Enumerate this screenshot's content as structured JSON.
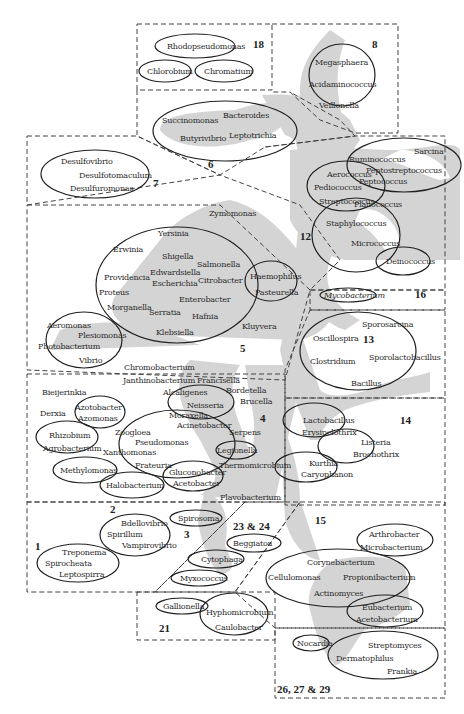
{
  "diagram": {
    "type": "phylogenetic-grouping-map",
    "colors": {
      "shade": "#d4d4d4",
      "line": "#1f1f1f",
      "dash": "#444444",
      "text": "#2b2b2b",
      "background": "#ffffff"
    },
    "groups": [
      {
        "id": "18",
        "label": "18",
        "members": [
          "Rhodopseudomonas",
          "Chlorobium",
          "Chromatium"
        ]
      },
      {
        "id": "8",
        "label": "8",
        "members": [
          "Megasphaera",
          "Acidaminococcus",
          "Veillonella"
        ]
      },
      {
        "id": "6",
        "label": "6",
        "members": [
          "Succinomonas",
          "Bacteroides",
          "Butyrivibrio",
          "Leptotrichia"
        ]
      },
      {
        "id": "7",
        "label": "7",
        "members": [
          "Desulfovibrio",
          "Desulfotomaculum",
          "Desulfuromonas"
        ]
      },
      {
        "id": "12",
        "label": "12",
        "members": [
          "Aerococcus",
          "Pediococcus",
          "Streptococcus",
          "Sarcina",
          "Ruminococcus",
          "Peptostreptococcus",
          "Peptococcus",
          "Planococcus",
          "Staphylococcus",
          "Micrococcus",
          "Deinococcus"
        ]
      },
      {
        "id": "5",
        "label": "5",
        "members": [
          "Zymomonas",
          "Yersinia",
          "Erwinia",
          "Shigella",
          "Salmonella",
          "Edwardsiella",
          "Providencia",
          "Escherichia",
          "Citrobacter",
          "Proteus",
          "Enterobacter",
          "Morganella",
          "Serratia",
          "Hafnia",
          "Klebsiella",
          "Haemophilus",
          "Pasteurella",
          "Kluyvera",
          "Aeromonas",
          "Plesiomonas",
          "Photobacterium",
          "Vibrio",
          "Chromobacterium"
        ]
      },
      {
        "id": "16",
        "label": "16",
        "members": [
          "Mycobacterium"
        ]
      },
      {
        "id": "13",
        "label": "13",
        "members": [
          "Sporosarcina",
          "Oscillospira",
          "Clostridium",
          "Sporolactobacillus",
          "Bacillus"
        ]
      },
      {
        "id": "4",
        "label": "4",
        "members": [
          "Janthinobacterium",
          "Francisella",
          "Bieijerinkia",
          "Alcaligenes",
          "Bordetella",
          "Brucella",
          "Derxia",
          "Azotobacter",
          "Azomonas",
          "Neisseria",
          "Moraxella",
          "Acinetobacter",
          "Serpens",
          "Rhizobium",
          "Agrobacterium",
          "Zoogloea",
          "Pseudomonas",
          "Xanthomonas",
          "Legionella",
          "Frateuria",
          "Thermomicrobium",
          "Methylomonas",
          "Gluconobacter",
          "Acetobacter",
          "Halobacterium",
          "Flavobacterium"
        ]
      },
      {
        "id": "14",
        "label": "14",
        "members": [
          "Lactobacillus",
          "Erysipelothrix",
          "Listeria",
          "Brochothrix",
          "Kurthia",
          "Caryophanon"
        ]
      },
      {
        "id": "1",
        "label": "1",
        "members": [
          "Treponema",
          "Spirocheata",
          "Leptospirra"
        ]
      },
      {
        "id": "2",
        "label": "2",
        "members": [
          "Bdellovibrio",
          "Spirillum",
          "Vampirovibrio"
        ]
      },
      {
        "id": "3",
        "label": "3",
        "members": [
          "Spirosoma"
        ]
      },
      {
        "id": "23-24",
        "label": "23 & 24",
        "members": [
          "Beggiatoa",
          "Cytophaga",
          "Myxococcus"
        ]
      },
      {
        "id": "15",
        "label": "15",
        "members": [
          "Arthrobacter",
          "Microbacterium",
          "Corynebacterium",
          "Cellulomonas",
          "Propionibacterium",
          "Actinomyces",
          "Eubacterium",
          "Acetobacterium"
        ]
      },
      {
        "id": "21",
        "label": "21",
        "members": [
          "Gallionella",
          "Hyphomicrobium",
          "Caulobacter"
        ]
      },
      {
        "id": "26-27-29",
        "label": "26, 27 & 29",
        "members": [
          "Nocardia",
          "Streptomyces",
          "Dermatophilus",
          "Frankia"
        ]
      }
    ],
    "numbers": {
      "n18": "18",
      "n8": "8",
      "n6": "6",
      "n7": "7",
      "n12": "12",
      "n5": "5",
      "n16": "16",
      "n13": "13",
      "n4": "4",
      "n14": "14",
      "n1": "1",
      "n2": "2",
      "n3": "3",
      "n2324": "23 & 24",
      "n15": "15",
      "n21": "21",
      "n262729": "26, 27 & 29"
    },
    "taxa": {
      "rhodopseudomonas": "Rhodopseudomonas",
      "chlorobium": "Chlorobium",
      "chromatium": "Chromatium",
      "megasphaera": "Megasphaera",
      "acidaminococcus": "Acidaminococcus",
      "veillonella": "Veillonella",
      "succinomonas": "Succinomonas",
      "bacteroides": "Bacteroides",
      "butyrivibrio": "Butyrivibrio",
      "leptotrichia": "Leptotrichia",
      "desulfovibrio": "Desulfovibrio",
      "desulfotomaculum": "Desulfotomaculum",
      "desulfuromonas": "Desulfuromonas",
      "aerococcus": "Aerococcus",
      "pediococcus": "Pediococcus",
      "streptococcus": "Streptococcus",
      "sarcina": "Sarcina",
      "ruminococcus": "Ruminococcus",
      "peptostreptococcus": "Peptostreptococcus",
      "peptococcus": "Peptococcus",
      "planococcus": "Planococcus",
      "staphylococcus": "Staphylococcus",
      "micrococcus": "Micrococcus",
      "deinococcus": "Deinococcus",
      "zymomonas": "Zymomonas",
      "yersinia": "Yersinia",
      "erwinia": "Erwinia",
      "shigella": "Shigella",
      "salmonella": "Salmonella",
      "edwardsiella": "Edwardsiella",
      "providencia": "Providencia",
      "escherichia": "Escherichia",
      "citrobacter": "Citrobacter",
      "proteus": "Proteus",
      "enterobacter": "Enterobacter",
      "morganella": "Morganella",
      "serratia": "Serratia",
      "hafnia": "Hafnia",
      "klebsiella": "Klebsiella",
      "haemophilus": "Haemophilus",
      "pasteurella": "Pasteurella",
      "kluyvera": "Kluyvera",
      "aeromonas": "Aeromonas",
      "plesiomonas": "Plesiomonas",
      "photobacterium": "Photobacterium",
      "vibrio": "Vibrio",
      "chromobacterium": "Chromobacterium",
      "mycobacterium": "Mycobacterium",
      "sporosarcina": "Sporosarcina",
      "oscillospira": "Oscillospira",
      "clostridium": "Clostridium",
      "sporolactobacillus": "Sporolactobacillus",
      "bacillus": "Bacillus",
      "janthinobacterium": "Janthinobacterium",
      "francisella": "Francisella",
      "bieijerinkia": "Bieijerinkia",
      "alcaligenes": "Alcaligenes",
      "bordetella": "Bordetella",
      "brucella": "Brucella",
      "derxia": "Derxia",
      "azotobacter": "Azotobacter",
      "azomonas": "Azomonas",
      "neisseria": "Neisseria",
      "moraxella": "Moraxella",
      "acinetobacter": "Acinetobacter",
      "serpens": "Serpens",
      "rhizobium": "Rhizobium",
      "agrobacterium": "Agrobacterium",
      "zoogloea": "Zoogloea",
      "pseudomonas": "Pseudomonas",
      "xanthomonas": "Xanthomonas",
      "legionella": "Legionella",
      "frateuria": "Frateuria",
      "thermomicrobium": "Thermomicrobium",
      "methylomonas": "Methylomonas",
      "gluconobacter": "Gluconobacter",
      "acetobacter": "Acetobacter",
      "halobacterium": "Halobacterium",
      "flavobacterium": "Flavobacterium",
      "lactobacillus": "Lactobacillus",
      "erysipelothrix": "Erysipelothrix",
      "listeria": "Listeria",
      "brochothrix": "Brochothrix",
      "kurthia": "Kurthia",
      "caryophanon": "Caryophanon",
      "bdellovibrio": "Bdellovibrio",
      "spirillum": "Spirillum",
      "vampirovibrio": "Vampirovibrio",
      "treponema": "Treponema",
      "spirocheata": "Spirocheata",
      "leptospirra": "Leptospirra",
      "spirosoma": "Spirosoma",
      "beggiatoa": "Beggiatoa",
      "cytophaga": "Cytophaga",
      "myxococcus": "Myxococcus",
      "arthrobacter": "Arthrobacter",
      "microbacterium": "Microbacterium",
      "corynebacterium": "Corynebacterium",
      "cellulomonas": "Cellulomonas",
      "propionibacterium": "Propionibacterium",
      "actinomyces": "Actinomyces",
      "eubacterium": "Eubacterium",
      "acetobacterium": "Acetobacterium",
      "gallionella": "Gallionella",
      "hyphomicrobium": "Hyphomicrobium",
      "caulobacter": "Caulobacter",
      "nocardia": "Nocardia",
      "streptomyces": "Streptomyces",
      "dermatophilus": "Dermatophilus",
      "frankia": "Frankia"
    }
  }
}
